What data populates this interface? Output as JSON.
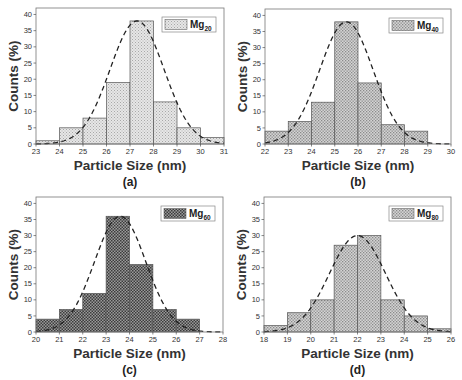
{
  "chart_data": [
    {
      "type": "bar",
      "panel_label": "(a)",
      "legend": {
        "name": "Mg",
        "subscript": "20"
      },
      "xlabel": "Particle Size (nm)",
      "ylabel": "Counts (%)",
      "xlim": [
        23,
        31
      ],
      "ylim": [
        0,
        42
      ],
      "xticks": [
        23,
        24,
        25,
        26,
        27,
        28,
        29,
        30,
        31
      ],
      "yticks": [
        0,
        5,
        10,
        15,
        20,
        25,
        30,
        35,
        40
      ],
      "bins": [
        [
          23,
          24
        ],
        [
          24,
          25
        ],
        [
          25,
          26
        ],
        [
          26,
          27
        ],
        [
          27,
          28
        ],
        [
          28,
          29
        ],
        [
          29,
          30
        ],
        [
          30,
          31
        ]
      ],
      "values": [
        1,
        5,
        8,
        19,
        38,
        13,
        5,
        2
      ],
      "fit": {
        "type": "gaussian",
        "mean": 27.3,
        "sigma": 1.15,
        "peak": 38
      },
      "pattern": "light"
    },
    {
      "type": "bar",
      "panel_label": "(b)",
      "legend": {
        "name": "Mg",
        "subscript": "40"
      },
      "xlabel": "Particle Size (nm)",
      "ylabel": "Counts (%)",
      "xlim": [
        22,
        30
      ],
      "ylim": [
        0,
        42
      ],
      "xticks": [
        22,
        23,
        24,
        25,
        26,
        27,
        28,
        29,
        30
      ],
      "yticks": [
        0,
        5,
        10,
        15,
        20,
        25,
        30,
        35,
        40
      ],
      "bins": [
        [
          22,
          23
        ],
        [
          23,
          24
        ],
        [
          24,
          25
        ],
        [
          25,
          26
        ],
        [
          26,
          27
        ],
        [
          27,
          28
        ],
        [
          28,
          29
        ]
      ],
      "values": [
        4,
        7,
        13,
        38,
        19,
        6,
        4
      ],
      "fit": {
        "type": "gaussian",
        "mean": 25.5,
        "sigma": 1.15,
        "peak": 38
      },
      "pattern": "medium"
    },
    {
      "type": "bar",
      "panel_label": "(c)",
      "legend": {
        "name": "Mg",
        "subscript": "60"
      },
      "xlabel": "Particle Size (nm)",
      "ylabel": "Counts (%)",
      "xlim": [
        20,
        28
      ],
      "ylim": [
        0,
        42
      ],
      "xticks": [
        20,
        21,
        22,
        23,
        24,
        25,
        26,
        27,
        28
      ],
      "yticks": [
        0,
        5,
        10,
        15,
        20,
        25,
        30,
        35,
        40
      ],
      "bins": [
        [
          20,
          21
        ],
        [
          21,
          22
        ],
        [
          22,
          23
        ],
        [
          23,
          24
        ],
        [
          24,
          25
        ],
        [
          25,
          26
        ],
        [
          26,
          27
        ]
      ],
      "values": [
        4,
        7,
        12,
        36,
        21,
        7,
        4
      ],
      "fit": {
        "type": "gaussian",
        "mean": 23.6,
        "sigma": 1.1,
        "peak": 36
      },
      "pattern": "dark"
    },
    {
      "type": "bar",
      "panel_label": "(d)",
      "legend": {
        "name": "Mg",
        "subscript": "80"
      },
      "xlabel": "Particle Size (nm)",
      "ylabel": "Counts (%)",
      "xlim": [
        18,
        26
      ],
      "ylim": [
        0,
        42
      ],
      "xticks": [
        18,
        19,
        20,
        21,
        22,
        23,
        24,
        25,
        26
      ],
      "yticks": [
        0,
        5,
        10,
        15,
        20,
        25,
        30,
        35,
        40
      ],
      "bins": [
        [
          18,
          19
        ],
        [
          19,
          20
        ],
        [
          20,
          21
        ],
        [
          21,
          22
        ],
        [
          22,
          23
        ],
        [
          23,
          24
        ],
        [
          24,
          25
        ],
        [
          25,
          26
        ]
      ],
      "values": [
        2,
        6,
        10,
        27,
        30,
        10,
        5,
        1
      ],
      "fit": {
        "type": "gaussian",
        "mean": 22.0,
        "sigma": 1.2,
        "peak": 30
      },
      "pattern": "medium"
    }
  ],
  "layout": {
    "panels": [
      {
        "left": 36,
        "top": 8,
        "right": 224,
        "bottom": 144
      },
      {
        "left": 265,
        "top": 9,
        "right": 451,
        "bottom": 144
      },
      {
        "left": 36,
        "top": 197,
        "right": 223,
        "bottom": 332
      },
      {
        "left": 264,
        "top": 197,
        "right": 451,
        "bottom": 332
      }
    ]
  }
}
